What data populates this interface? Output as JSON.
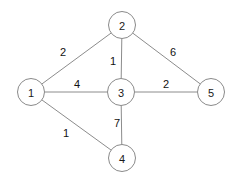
{
  "figure": {
    "background_color": "#ffffff",
    "node_fill_color": "#ffffff",
    "node_stroke_color": "#8a8a8a",
    "edge_color": "#8c8c8c",
    "label_color": "#111111",
    "width": 239,
    "height": 183
  },
  "chart_data": {
    "type": "diagram",
    "diagram_kind": "weighted-undirected-graph",
    "directed": false,
    "weighted": true,
    "node_radius": 13.5,
    "nodes": [
      {
        "id": "1",
        "label": "1",
        "x": 31,
        "y": 92
      },
      {
        "id": "2",
        "label": "2",
        "x": 122,
        "y": 25
      },
      {
        "id": "3",
        "label": "3",
        "x": 121,
        "y": 92
      },
      {
        "id": "4",
        "label": "4",
        "x": 122,
        "y": 158
      },
      {
        "id": "5",
        "label": "5",
        "x": 211,
        "y": 92
      }
    ],
    "edges": [
      {
        "id": "e12",
        "source": "1",
        "target": "2",
        "weight": 2,
        "label": "2",
        "label_x": 63,
        "label_y": 52
      },
      {
        "id": "e13",
        "source": "1",
        "target": "3",
        "weight": 4,
        "label": "4",
        "label_x": 77,
        "label_y": 84
      },
      {
        "id": "e14",
        "source": "1",
        "target": "4",
        "weight": 1,
        "label": "1",
        "label_x": 66,
        "label_y": 133
      },
      {
        "id": "e23",
        "source": "2",
        "target": "3",
        "weight": 1,
        "label": "1",
        "label_x": 113,
        "label_y": 61
      },
      {
        "id": "e25",
        "source": "2",
        "target": "5",
        "weight": 6,
        "label": "6",
        "label_x": 173,
        "label_y": 52
      },
      {
        "id": "e34",
        "source": "3",
        "target": "4",
        "weight": 7,
        "label": "7",
        "label_x": 117,
        "label_y": 123
      },
      {
        "id": "e35",
        "source": "3",
        "target": "5",
        "weight": 2,
        "label": "2",
        "label_x": 166,
        "label_y": 84
      }
    ],
    "adjacency_summary": [
      "1 - 2 : 2",
      "1 - 3 : 4",
      "1 - 4 : 1",
      "2 - 3 : 1",
      "2 - 5 : 6",
      "3 - 4 : 7",
      "3 - 5 : 2"
    ]
  }
}
